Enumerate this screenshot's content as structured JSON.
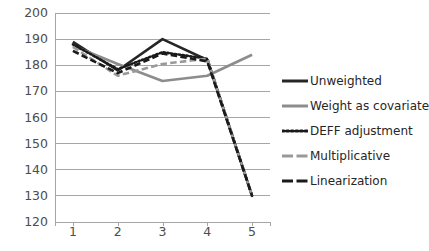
{
  "chart_data": {
    "type": "line",
    "title": "",
    "subtitle": "",
    "xlabel": "",
    "ylabel": "",
    "x": [
      1,
      2,
      3,
      4,
      5
    ],
    "categories": [
      "1",
      "2",
      "3",
      "4",
      "5"
    ],
    "xlim": [
      0.6,
      5.4
    ],
    "ylim": [
      120,
      200
    ],
    "y_ticks": [
      120,
      130,
      140,
      150,
      160,
      170,
      180,
      190,
      200
    ],
    "x_ticks": [
      "1",
      "2",
      "3",
      "4",
      "5"
    ],
    "grid": "horizontal",
    "legend_position": "right",
    "series": [
      {
        "name": "Unweighted",
        "values": [
          189,
          178,
          190,
          182,
          130
        ],
        "color": "#262626",
        "style": "solid",
        "width": 2.6
      },
      {
        "name": "Weight as covariate",
        "values": [
          187.5,
          180.5,
          174,
          176,
          184
        ],
        "color": "#8c8c8c",
        "style": "solid",
        "width": 2.6
      },
      {
        "name": "DEFF adjustment",
        "values": [
          188,
          178.5,
          185,
          182.5,
          130
        ],
        "color": "#1a1a1a",
        "style": "dotted",
        "width": 2.6
      },
      {
        "name": "Multiplicative",
        "values": [
          187,
          176,
          180.5,
          182.5,
          130
        ],
        "color": "#999999",
        "style": "dashed",
        "width": 2.6
      },
      {
        "name": "Linearization",
        "values": [
          185.5,
          177,
          184.5,
          181.5,
          130
        ],
        "color": "#1a1a1a",
        "style": "dashed",
        "width": 2.6
      }
    ]
  },
  "axis": {
    "y_tick_labels": [
      "200",
      "190",
      "180",
      "170",
      "160",
      "150",
      "140",
      "130",
      "120"
    ],
    "x_tick_labels": [
      "1",
      "2",
      "3",
      "4",
      "5"
    ]
  },
  "legend": {
    "items": [
      {
        "label": "Unweighted"
      },
      {
        "label": "Weight as covariate"
      },
      {
        "label": "DEFF adjustment"
      },
      {
        "label": "Multiplicative"
      },
      {
        "label": "Linearization"
      }
    ]
  },
  "colors": {
    "gridline": "#a6a6a6",
    "axis": "#a6a6a6",
    "tick_text": "#4d4d4d",
    "legend_text": "#262626",
    "background": "#ffffff"
  }
}
